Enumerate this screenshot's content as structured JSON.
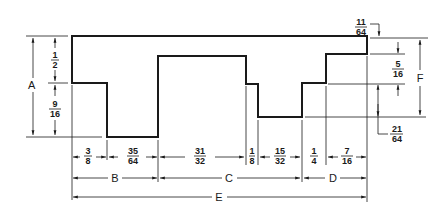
{
  "drawing": {
    "title": "Stepped profile dimension drawing",
    "vertical_dims": {
      "A": "A",
      "F": "F",
      "top_left": {
        "num": "1",
        "den": "2"
      },
      "bottom_left": {
        "num": "9",
        "den": "16"
      },
      "top_right_callout": {
        "num": "11",
        "den": "64"
      },
      "right_step": {
        "num": "5",
        "den": "16"
      },
      "right_lower_callout": {
        "num": "21",
        "den": "64"
      }
    },
    "horizontal_dims": [
      {
        "num": "3",
        "den": "8"
      },
      {
        "num": "35",
        "den": "64"
      },
      {
        "num": "31",
        "den": "32"
      },
      {
        "num": "1",
        "den": "8"
      },
      {
        "num": "15",
        "den": "32"
      },
      {
        "num": "1",
        "den": "4"
      },
      {
        "num": "7",
        "den": "16"
      }
    ],
    "overall_dims": {
      "B": "B",
      "C": "C",
      "D": "D",
      "E": "E"
    }
  }
}
